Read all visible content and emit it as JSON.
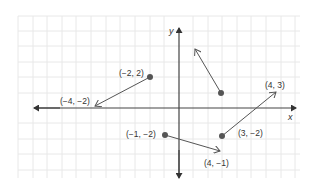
{
  "diagram": {
    "type": "coordinate-plane-vectors",
    "axes": {
      "x_label": "x",
      "y_label": "y"
    },
    "colors": {
      "grid": "#e6e6e6",
      "axis": "#444444",
      "vector": "#555555",
      "dot": "#555555",
      "text": "#333333"
    },
    "labels": {
      "p1": "(−2, 2)",
      "p2": "(−4, −2)",
      "p3": "(4, 3)",
      "p4": "(−1, −2)",
      "p5": "(3, −2)",
      "p6": "(4, −1)"
    },
    "vectors": [
      {
        "from_label": "(−2, 2)",
        "to_label": "(−4, −2)"
      },
      {
        "from_label": "(3, −2)",
        "to_label": "(4, 3)"
      },
      {
        "from_label": "(−1, −2)",
        "to_label": "(4, −1)"
      },
      {
        "from_label": "unlabeled dot",
        "to_label": "unlabeled head"
      }
    ]
  }
}
